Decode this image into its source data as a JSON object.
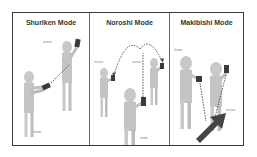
{
  "panels": [
    {
      "title": "Shuriken Mode",
      "labels": {
        "top": "receiver",
        "bottom": "thrower"
      }
    },
    {
      "title": "Noroshi Mode",
      "labels": {
        "left": "receiver",
        "middle": "receiver",
        "bottom": "sender"
      }
    },
    {
      "title": "Makibishi Mode",
      "labels": {
        "left": "thrower",
        "right": "receiver"
      }
    }
  ],
  "colors": {
    "figure": "#c8c8c8",
    "figure_shade": "#a8a8a8",
    "device": "#3a3a3a",
    "dotted_line": "#555555",
    "arrow": "#444444",
    "border": "#3a3a3a"
  }
}
